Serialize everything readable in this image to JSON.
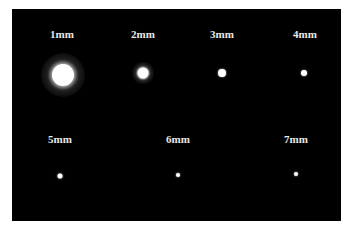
{
  "image": {
    "background": "#000000",
    "spots": [
      {
        "label": "1mm",
        "lx": 62,
        "ly": 28,
        "cx": 63,
        "cy": 75,
        "d": 22,
        "halo": 44
      },
      {
        "label": "2mm",
        "lx": 143,
        "ly": 28,
        "cx": 143,
        "cy": 73,
        "d": 11,
        "halo": 22
      },
      {
        "label": "3mm",
        "lx": 222,
        "ly": 28,
        "cx": 222,
        "cy": 73,
        "d": 8,
        "halo": 0
      },
      {
        "label": "4mm",
        "lx": 305,
        "ly": 28,
        "cx": 304,
        "cy": 73,
        "d": 6,
        "halo": 0
      },
      {
        "label": "5mm",
        "lx": 60,
        "ly": 133,
        "cx": 60,
        "cy": 176,
        "d": 5,
        "halo": 0
      },
      {
        "label": "6mm",
        "lx": 178,
        "ly": 133,
        "cx": 178,
        "cy": 175,
        "d": 4,
        "halo": 0
      },
      {
        "label": "7mm",
        "lx": 296,
        "ly": 133,
        "cx": 296,
        "cy": 174,
        "d": 4,
        "halo": 0
      }
    ]
  }
}
